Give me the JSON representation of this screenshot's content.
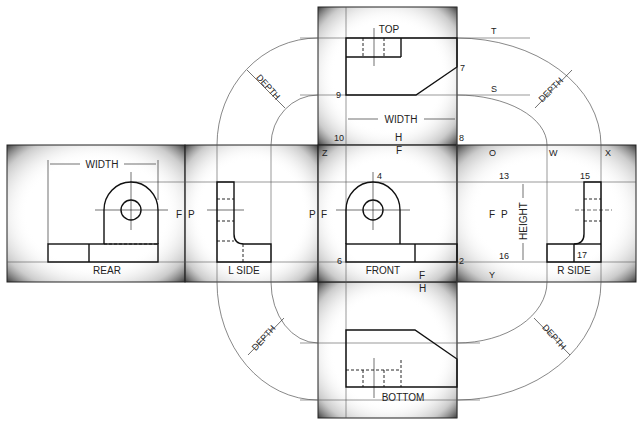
{
  "diagram": {
    "views": {
      "top": "TOP",
      "front": "FRONT",
      "rear": "REAR",
      "left_side": "L SIDE",
      "right_side": "R SIDE",
      "bottom": "BOTTOM"
    },
    "dimensions": {
      "width_top": "WIDTH",
      "width_rear": "WIDTH",
      "height": "HEIGHT",
      "depth": "DEPTH"
    },
    "fold_line_labels": {
      "F": "F",
      "P": "P",
      "H": "H"
    },
    "point_labels": {
      "T": "T",
      "S": "S",
      "Z": "Z",
      "O": "O",
      "W": "W",
      "X": "X",
      "Y": "Y",
      "n2": "2",
      "n4": "4",
      "n6": "6",
      "n7": "7",
      "n8": "8",
      "n9": "9",
      "n10": "10",
      "n13": "13",
      "n15": "15",
      "n16": "16",
      "n17": "17"
    }
  }
}
